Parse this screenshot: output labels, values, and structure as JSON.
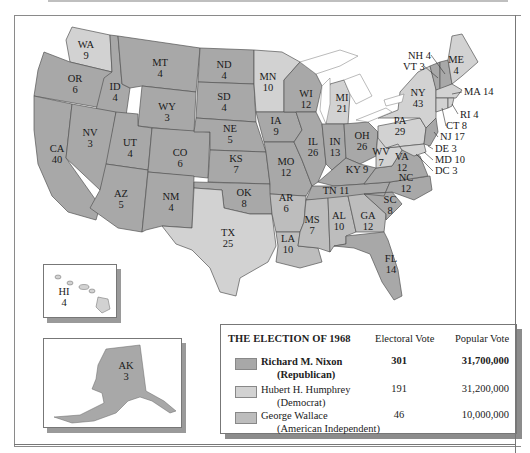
{
  "map": {
    "title": "THE ELECTION OF 1968",
    "colors": {
      "republican": "#a8a8a8",
      "democrat": "#d2d2d2",
      "american_independent": "#bdbdbd",
      "state_border": "#555555",
      "water": "#ffffff"
    },
    "states": [
      {
        "abbr": "WA",
        "votes": "9",
        "party": "democrat"
      },
      {
        "abbr": "OR",
        "votes": "6",
        "party": "republican"
      },
      {
        "abbr": "CA",
        "votes": "40",
        "party": "republican"
      },
      {
        "abbr": "ID",
        "votes": "4",
        "party": "republican"
      },
      {
        "abbr": "NV",
        "votes": "3",
        "party": "republican"
      },
      {
        "abbr": "MT",
        "votes": "4",
        "party": "republican"
      },
      {
        "abbr": "WY",
        "votes": "3",
        "party": "republican"
      },
      {
        "abbr": "UT",
        "votes": "4",
        "party": "republican"
      },
      {
        "abbr": "AZ",
        "votes": "5",
        "party": "republican"
      },
      {
        "abbr": "CO",
        "votes": "6",
        "party": "republican"
      },
      {
        "abbr": "NM",
        "votes": "4",
        "party": "republican"
      },
      {
        "abbr": "ND",
        "votes": "4",
        "party": "republican"
      },
      {
        "abbr": "SD",
        "votes": "4",
        "party": "republican"
      },
      {
        "abbr": "NE",
        "votes": "5",
        "party": "republican"
      },
      {
        "abbr": "KS",
        "votes": "7",
        "party": "republican"
      },
      {
        "abbr": "OK",
        "votes": "8",
        "party": "republican"
      },
      {
        "abbr": "TX",
        "votes": "25",
        "party": "democrat"
      },
      {
        "abbr": "MN",
        "votes": "10",
        "party": "democrat"
      },
      {
        "abbr": "IA",
        "votes": "9",
        "party": "republican"
      },
      {
        "abbr": "MO",
        "votes": "12",
        "party": "republican"
      },
      {
        "abbr": "AR",
        "votes": "6",
        "party": "american_independent"
      },
      {
        "abbr": "LA",
        "votes": "10",
        "party": "american_independent"
      },
      {
        "abbr": "WI",
        "votes": "12",
        "party": "republican"
      },
      {
        "abbr": "IL",
        "votes": "26",
        "party": "republican"
      },
      {
        "abbr": "MI",
        "votes": "21",
        "party": "democrat"
      },
      {
        "abbr": "IN",
        "votes": "13",
        "party": "republican"
      },
      {
        "abbr": "OH",
        "votes": "26",
        "party": "republican"
      },
      {
        "abbr": "KY",
        "votes": "9",
        "party": "republican"
      },
      {
        "abbr": "TN",
        "votes": "11",
        "party": "republican"
      },
      {
        "abbr": "MS",
        "votes": "7",
        "party": "american_independent"
      },
      {
        "abbr": "AL",
        "votes": "10",
        "party": "american_independent"
      },
      {
        "abbr": "GA",
        "votes": "12",
        "party": "american_independent"
      },
      {
        "abbr": "FL",
        "votes": "14",
        "party": "republican"
      },
      {
        "abbr": "SC",
        "votes": "8",
        "party": "republican"
      },
      {
        "abbr": "NC",
        "votes": "12",
        "party": "republican"
      },
      {
        "abbr": "VA",
        "votes": "12",
        "party": "republican"
      },
      {
        "abbr": "WV",
        "votes": "7",
        "party": "democrat"
      },
      {
        "abbr": "PA",
        "votes": "29",
        "party": "democrat"
      },
      {
        "abbr": "NY",
        "votes": "43",
        "party": "democrat"
      },
      {
        "abbr": "VT",
        "votes": "3",
        "party": "republican"
      },
      {
        "abbr": "NH",
        "votes": "4",
        "party": "republican"
      },
      {
        "abbr": "ME",
        "votes": "4",
        "party": "democrat"
      },
      {
        "abbr": "MA",
        "votes": "14",
        "party": "democrat"
      },
      {
        "abbr": "RI",
        "votes": "4",
        "party": "democrat"
      },
      {
        "abbr": "CT",
        "votes": "8",
        "party": "democrat"
      },
      {
        "abbr": "NJ",
        "votes": "17",
        "party": "republican"
      },
      {
        "abbr": "DE",
        "votes": "3",
        "party": "republican"
      },
      {
        "abbr": "MD",
        "votes": "10",
        "party": "democrat"
      },
      {
        "abbr": "DC",
        "votes": "3",
        "party": "democrat"
      },
      {
        "abbr": "HI",
        "votes": "4",
        "party": "democrat"
      },
      {
        "abbr": "AK",
        "votes": "3",
        "party": "republican"
      }
    ],
    "labels": {
      "WA": "WA",
      "WA_v": "9",
      "OR": "OR",
      "OR_v": "6",
      "CA": "CA",
      "CA_v": "40",
      "ID": "ID",
      "ID_v": "4",
      "NV": "NV",
      "NV_v": "3",
      "MT": "MT",
      "MT_v": "4",
      "WY": "WY",
      "WY_v": "3",
      "UT": "UT",
      "UT_v": "4",
      "AZ": "AZ",
      "AZ_v": "5",
      "CO": "CO",
      "CO_v": "6",
      "NM": "NM",
      "NM_v": "4",
      "ND": "ND",
      "ND_v": "4",
      "SD": "SD",
      "SD_v": "4",
      "NE": "NE",
      "NE_v": "5",
      "KS": "KS",
      "KS_v": "7",
      "OK": "OK",
      "OK_v": "8",
      "TX": "TX",
      "TX_v": "25",
      "MN": "MN",
      "MN_v": "10",
      "IA": "IA",
      "IA_v": "9",
      "MO": "MO",
      "MO_v": "12",
      "AR": "AR",
      "AR_v": "6",
      "LA": "LA",
      "LA_v": "10",
      "WI": "WI",
      "WI_v": "12",
      "IL": "IL",
      "IL_v": "26",
      "MI": "MI",
      "MI_v": "21",
      "IN": "IN",
      "IN_v": "13",
      "OH": "OH",
      "OH_v": "26",
      "KY": "KY 9",
      "TN": "TN 11",
      "MS": "MS",
      "MS_v": "7",
      "AL": "AL",
      "AL_v": "10",
      "GA": "GA",
      "GA_v": "12",
      "FL": "FL",
      "FL_v": "14",
      "SC": "SC",
      "SC_v": "8",
      "NC": "NC",
      "NC_v": "12",
      "VA": "VA",
      "VA_v": "12",
      "WV": "WV",
      "WV_v": "7",
      "PA": "PA",
      "PA_v": "29",
      "NY": "NY",
      "NY_v": "43",
      "ME": "ME",
      "ME_v": "4",
      "NH": "NH 4",
      "VT": "VT 3",
      "MA": "MA 14",
      "RI": "RI 4",
      "CT": "CT 8",
      "NJ": "NJ 17",
      "DE": "DE 3",
      "MD": "MD 10",
      "DC": "DC 3",
      "HI": "HI",
      "HI_v": "4",
      "AK": "AK",
      "AK_v": "3"
    }
  },
  "legend": {
    "title": "THE ELECTION OF 1968",
    "col_electoral": "Electoral Vote",
    "col_popular": "Popular Vote",
    "rows": [
      {
        "name": "Richard M. Nixon",
        "party": "(Republican)",
        "electoral": "301",
        "popular": "31,700,000",
        "color": "#a8a8a8",
        "bold": true
      },
      {
        "name": "Hubert H. Humphrey",
        "party": "(Democrat)",
        "electoral": "191",
        "popular": "31,200,000",
        "color": "#d2d2d2",
        "bold": false
      },
      {
        "name": "George Wallace",
        "party": "(American Independent)",
        "electoral": "46",
        "popular": "10,000,000",
        "color": "#bdbdbd",
        "bold": false
      }
    ]
  }
}
